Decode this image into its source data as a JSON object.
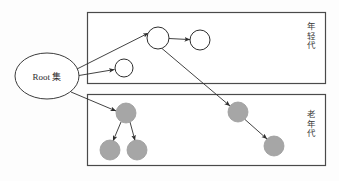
{
  "figure": {
    "background": "#fdfdfd",
    "stroke_color": "#3c3c3c",
    "young_fill": "#ffffff",
    "old_fill": "#a6a6a6",
    "box_border": "#4a4a4a"
  },
  "root": {
    "label": "Root 集",
    "shape": "ellipse",
    "cx": 47,
    "cy": 76,
    "rx": 32,
    "ry": 23,
    "fill": "#ffffff"
  },
  "regions": [
    {
      "id": "young-generation",
      "label": "年轻代",
      "x": 87,
      "y": 12,
      "width": 239,
      "height": 72
    },
    {
      "id": "old-generation",
      "label": "老年代",
      "x": 87,
      "y": 94,
      "width": 239,
      "height": 72
    }
  ],
  "nodes": [
    {
      "id": "young-small",
      "region": "young-generation",
      "cx": 124,
      "cy": 68,
      "r": 9,
      "fill": "#ffffff"
    },
    {
      "id": "young-top",
      "region": "young-generation",
      "cx": 158,
      "cy": 38,
      "r": 11,
      "fill": "#ffffff"
    },
    {
      "id": "young-right",
      "region": "young-generation",
      "cx": 200,
      "cy": 40,
      "r": 10,
      "fill": "#ffffff"
    },
    {
      "id": "old-parent",
      "region": "old-generation",
      "cx": 126,
      "cy": 113,
      "r": 10,
      "fill": "#a6a6a6"
    },
    {
      "id": "old-child-l",
      "region": "old-generation",
      "cx": 110,
      "cy": 150,
      "r": 10,
      "fill": "#a6a6a6"
    },
    {
      "id": "old-child-r",
      "region": "old-generation",
      "cx": 137,
      "cy": 150,
      "r": 10,
      "fill": "#a6a6a6"
    },
    {
      "id": "old-mid",
      "region": "old-generation",
      "cx": 238,
      "cy": 112,
      "r": 10,
      "fill": "#a6a6a6"
    },
    {
      "id": "old-far",
      "region": "old-generation",
      "cx": 274,
      "cy": 146,
      "r": 10,
      "fill": "#a6a6a6"
    }
  ],
  "edges": [
    {
      "id": "root-to-young-top",
      "from": "root",
      "to": "young-top"
    },
    {
      "id": "root-to-young-small",
      "from": "root",
      "to": "young-small"
    },
    {
      "id": "root-to-old-parent",
      "from": "root",
      "to": "old-parent"
    },
    {
      "id": "young-top-to-right",
      "from": "young-top",
      "to": "young-right"
    },
    {
      "id": "young-top-to-old-mid",
      "from": "young-top",
      "to": "old-mid"
    },
    {
      "id": "old-parent-to-child-l",
      "from": "old-parent",
      "to": "old-child-l"
    },
    {
      "id": "old-parent-to-child-r",
      "from": "old-parent",
      "to": "old-child-r"
    },
    {
      "id": "old-mid-to-old-far",
      "from": "old-mid",
      "to": "old-far"
    }
  ]
}
